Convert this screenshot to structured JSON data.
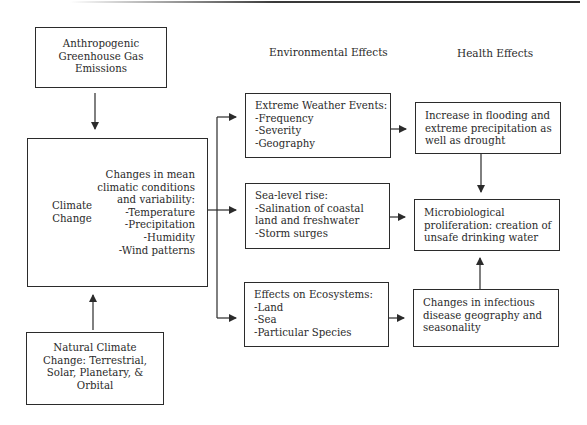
{
  "column_headings": {
    "environmental": "Environmental Effects",
    "health": "Health Effects"
  },
  "sources": {
    "anthropogenic": {
      "lines": [
        "Anthropogenic",
        "Greenhouse Gas",
        "Emissions"
      ]
    },
    "natural": {
      "lines": [
        "Natural Climate",
        "Change: Terrestrial,",
        "Solar, Planetary, &",
        "Orbital"
      ]
    }
  },
  "climate_change": {
    "label_lines": [
      "Climate",
      "Change"
    ],
    "detail_lines": [
      "Changes in mean",
      "climatic conditions",
      "and variability:",
      "-Temperature",
      "-Precipitation",
      "-Humidity",
      "-Wind patterns"
    ]
  },
  "environmental_effects": [
    {
      "lines": [
        "Extreme Weather Events:",
        "-Frequency",
        "-Severity",
        "-Geography"
      ]
    },
    {
      "lines": [
        "Sea-level rise:",
        "-Salination of coastal",
        "land and freshwater",
        "-Storm surges"
      ]
    },
    {
      "lines": [
        "Effects on Ecosystems:",
        "-Land",
        "-Sea",
        "-Particular Species"
      ]
    }
  ],
  "health_effects": [
    {
      "lines": [
        "Increase in flooding and",
        "extreme precipitation as",
        "well as drought"
      ]
    },
    {
      "lines": [
        "Microbiological",
        "proliferation: creation of",
        "unsafe drinking water"
      ]
    },
    {
      "lines": [
        "Changes in infectious",
        "disease geography and",
        "seasonality"
      ]
    }
  ],
  "colors": {
    "line": "#2b2b2b",
    "text": "#2a2a2a",
    "background": "#ffffff"
  }
}
